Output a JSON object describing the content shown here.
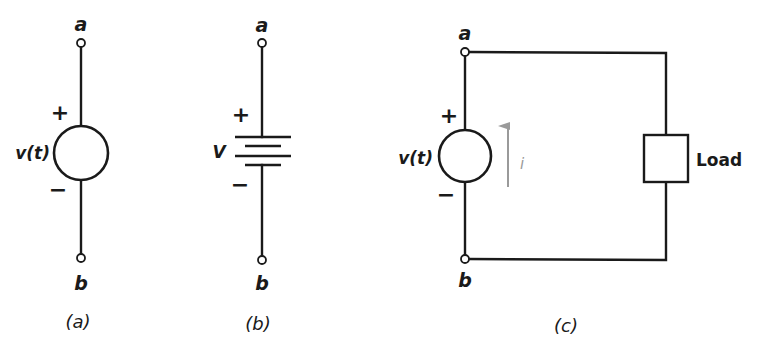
{
  "figure": {
    "panels": [
      {
        "id": "a",
        "caption": "(a)",
        "type": "ideal voltage source",
        "source_label": "v(t)",
        "top_terminal": "a",
        "bottom_terminal": "b",
        "plus": "+",
        "minus": "−"
      },
      {
        "id": "b",
        "caption": "(b)",
        "type": "battery (DC source)",
        "source_label": "V",
        "top_terminal": "a",
        "bottom_terminal": "b",
        "plus": "+",
        "minus": "−"
      },
      {
        "id": "c",
        "caption": "(c)",
        "type": "source connected to load",
        "source_label": "v(t)",
        "top_terminal": "a",
        "bottom_terminal": "b",
        "plus": "+",
        "minus": "−",
        "current_label": "i",
        "load_label": "Load"
      }
    ],
    "colors": {
      "line": "#1a1a1a",
      "current_arrow": "#9a9a9a",
      "background": "#ffffff"
    }
  }
}
